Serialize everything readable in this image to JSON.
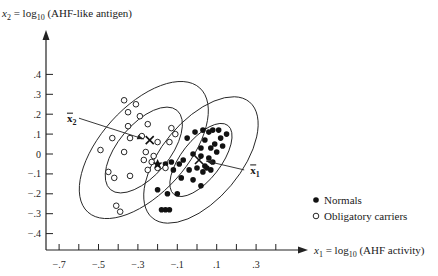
{
  "chart_data": {
    "type": "scatter",
    "title": "",
    "xlabel": "x1 = log10 (AHF activity)",
    "ylabel": "x2 = log10 (AHF-like antigen)",
    "xlabel_parts": {
      "var": "x",
      "sub": "1",
      "eq": " = log",
      "logsub": "10",
      "rest": " (AHF activity)"
    },
    "ylabel_parts": {
      "var": "x",
      "sub": "2",
      "eq": " = log",
      "logsub": "10",
      "rest": " (AHF-like antigen)"
    },
    "x_ticks": [
      -0.7,
      -0.6,
      -0.5,
      -0.4,
      -0.3,
      -0.2,
      -0.1,
      0.0,
      0.1,
      0.2,
      0.3,
      0.4
    ],
    "x_tick_labels": [
      {
        "value": -0.7,
        "label": "−.7"
      },
      {
        "value": -0.5,
        "label": "−.5"
      },
      {
        "value": -0.3,
        "label": "−.3"
      },
      {
        "value": -0.1,
        "label": "−.1"
      },
      {
        "value": 0.1,
        "label": ".1"
      },
      {
        "value": 0.3,
        "label": ".3"
      }
    ],
    "y_ticks": [
      {
        "value": 0.4,
        "label": ".4"
      },
      {
        "value": 0.3,
        "label": ".3"
      },
      {
        "value": 0.2,
        "label": ".2"
      },
      {
        "value": 0.1,
        "label": ".1"
      },
      {
        "value": 0.0,
        "label": "0"
      },
      {
        "value": -0.1,
        "label": "−.1"
      },
      {
        "value": -0.2,
        "label": "−.2"
      },
      {
        "value": -0.3,
        "label": "−.3"
      },
      {
        "value": -0.4,
        "label": "−.4"
      }
    ],
    "xlim": [
      -0.8,
      0.5
    ],
    "ylim": [
      -0.48,
      0.48
    ],
    "grid": false,
    "legend_position": "lower right",
    "series": [
      {
        "name": "Normals",
        "marker": "filled-circle",
        "points": [
          [
            -0.01,
            0.11
          ],
          [
            0.03,
            0.12
          ],
          [
            0.06,
            0.11
          ],
          [
            0.08,
            0.12
          ],
          [
            0.11,
            0.12
          ],
          [
            0.15,
            0.1
          ],
          [
            -0.05,
            0.08
          ],
          [
            0.04,
            0.07
          ],
          [
            0.09,
            0.05
          ],
          [
            0.12,
            0.08
          ],
          [
            0.02,
            0.03
          ],
          [
            0.07,
            0.03
          ],
          [
            0.1,
            0.01
          ],
          [
            0.13,
            0.04
          ],
          [
            -0.02,
            0.0
          ],
          [
            0.02,
            -0.01
          ],
          [
            0.06,
            -0.02
          ],
          [
            -0.13,
            -0.04
          ],
          [
            -0.09,
            -0.05
          ],
          [
            -0.07,
            -0.03
          ],
          [
            -0.16,
            -0.05
          ],
          [
            -0.12,
            -0.08
          ],
          [
            -0.04,
            -0.08
          ],
          [
            0.0,
            -0.07
          ],
          [
            0.04,
            -0.06
          ],
          [
            0.08,
            -0.04
          ],
          [
            0.03,
            -0.09
          ],
          [
            0.07,
            -0.08
          ],
          [
            -0.08,
            -0.12
          ],
          [
            -0.02,
            -0.13
          ],
          [
            0.02,
            -0.16
          ],
          [
            -0.1,
            -0.2
          ],
          [
            -0.15,
            -0.2
          ],
          [
            -0.16,
            -0.28
          ],
          [
            -0.18,
            -0.28
          ],
          [
            -0.14,
            -0.28
          ],
          [
            -0.2,
            -0.18
          ],
          [
            0.05,
            -0.07
          ]
        ]
      },
      {
        "name": "Obligatory carriers",
        "marker": "open-circle",
        "points": [
          [
            -0.37,
            0.27
          ],
          [
            -0.31,
            0.25
          ],
          [
            -0.35,
            0.21
          ],
          [
            -0.29,
            0.19
          ],
          [
            -0.25,
            0.15
          ],
          [
            -0.35,
            0.14
          ],
          [
            -0.34,
            0.08
          ],
          [
            -0.28,
            0.09
          ],
          [
            -0.2,
            0.06
          ],
          [
            -0.43,
            0.08
          ],
          [
            -0.49,
            0.02
          ],
          [
            -0.37,
            0.01
          ],
          [
            -0.26,
            0.01
          ],
          [
            -0.22,
            -0.01
          ],
          [
            -0.27,
            -0.03
          ],
          [
            -0.23,
            -0.04
          ],
          [
            -0.2,
            -0.07
          ],
          [
            -0.16,
            -0.07
          ],
          [
            -0.45,
            -0.09
          ],
          [
            -0.42,
            -0.12
          ],
          [
            -0.34,
            -0.11
          ],
          [
            -0.41,
            -0.26
          ],
          [
            -0.39,
            -0.29
          ],
          [
            -0.13,
            0.13
          ],
          [
            -0.11,
            0.1
          ],
          [
            -0.14,
            0.06
          ],
          [
            -0.25,
            -0.08
          ]
        ]
      }
    ],
    "means": [
      {
        "name": "x̄₁",
        "label": "x",
        "sub": "1",
        "x": 0.01,
        "y": -0.03,
        "label_at": [
          0.27,
          -0.08
        ]
      },
      {
        "name": "x̄₂",
        "label": "x",
        "sub": "2",
        "x": -0.24,
        "y": 0.07,
        "label_at": [
          -0.66,
          0.18
        ]
      }
    ],
    "ellipses": [
      {
        "group": "Obligatory carriers",
        "level": "inner",
        "cx": -0.27,
        "cy": 0.02,
        "rx": 0.13,
        "ry": 0.26,
        "angle_deg": 40
      },
      {
        "group": "Obligatory carriers",
        "level": "outer",
        "cx": -0.27,
        "cy": 0.02,
        "rx": 0.22,
        "ry": 0.42,
        "angle_deg": 42
      },
      {
        "group": "Normals",
        "level": "inner",
        "cx": 0.02,
        "cy": -0.03,
        "rx": 0.1,
        "ry": 0.22,
        "angle_deg": 38
      },
      {
        "group": "Normals",
        "level": "outer",
        "cx": 0.02,
        "cy": -0.03,
        "rx": 0.2,
        "ry": 0.38,
        "angle_deg": 40
      }
    ],
    "legend": [
      {
        "label": "Normals",
        "marker": "filled-circle"
      },
      {
        "label": "Obligatory carriers",
        "marker": "open-circle"
      }
    ]
  }
}
